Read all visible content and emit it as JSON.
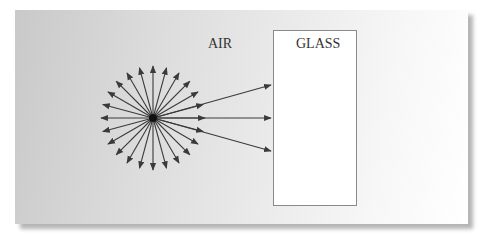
{
  "diagram": {
    "labels": {
      "air": "AIR",
      "glass": "GLASS"
    },
    "source": {
      "cx": 153,
      "cy": 118,
      "ray_count": 24,
      "ray_length": 52
    },
    "rays_to_glass": [
      {
        "x2": 271,
        "y2": 85
      },
      {
        "x2": 271,
        "y2": 118
      },
      {
        "x2": 271,
        "y2": 151
      }
    ],
    "colors": {
      "ray": "#3a3a3a",
      "glass_border": "#8a8a8a"
    }
  }
}
